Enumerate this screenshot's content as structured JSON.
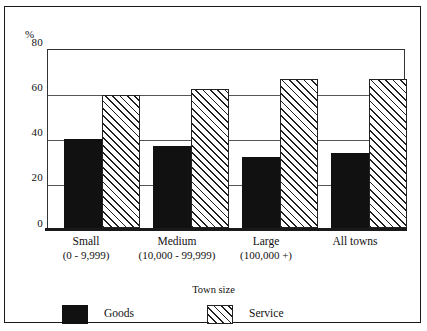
{
  "chart_data": {
    "type": "bar",
    "title": "",
    "xlabel": "Town size",
    "ylabel": "%",
    "ylim": [
      0,
      80
    ],
    "yticks": [
      "0",
      "20",
      "40",
      "60",
      "80"
    ],
    "grid": true,
    "legend_position": "bottom",
    "categories": [
      {
        "line1": "Small",
        "line2": "(0 - 9,999)"
      },
      {
        "line1": "Medium",
        "line2": "(10,000 - 99,999)"
      },
      {
        "line1": "Large",
        "line2": "(100,000 +)"
      },
      {
        "line1": "All towns",
        "line2": ""
      }
    ],
    "series": [
      {
        "name": "Goods",
        "values": [
          40,
          37,
          32,
          33.5
        ],
        "color": "#111111",
        "fill": "solid-black"
      },
      {
        "name": "Service",
        "values": [
          60,
          62.5,
          67,
          67
        ],
        "color": "#1f1f1f",
        "fill": "diagonal-hatch"
      }
    ]
  },
  "legend": {
    "items": [
      {
        "label": "Goods"
      },
      {
        "label": "Service"
      }
    ]
  }
}
